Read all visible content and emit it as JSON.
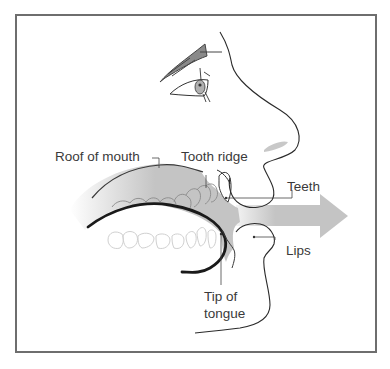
{
  "diagram": {
    "type": "anatomical-cross-section",
    "labels": {
      "roof_of_mouth": "Roof of mouth",
      "tooth_ridge": "Tooth ridge",
      "teeth": "Teeth",
      "lips": "Lips",
      "tip_of_tongue_line1": "Tip of",
      "tip_of_tongue_line2": "tongue"
    },
    "colors": {
      "frame": "#6e6e6e",
      "airflow": "#c4c4c4",
      "palate_fill": "#bdbdbd",
      "outline": "#2a2a2a",
      "tongue": "#1a1a1a",
      "teeth_outline": "#cfcfcf",
      "label_text": "#3a3a3a"
    },
    "arrow_direction": "right"
  }
}
